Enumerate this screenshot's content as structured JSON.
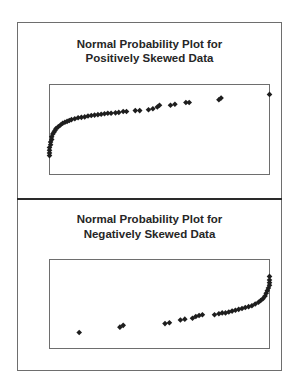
{
  "chart_data": [
    {
      "type": "scatter",
      "title": "Normal Probability Plot for Positively Skewed Data",
      "title_lines": [
        "Normal Probability Plot for",
        "Positively Skewed Data"
      ],
      "xlabel": "",
      "ylabel": "",
      "grid": false,
      "legend": null,
      "note": "Coordinates are normalized within plot area (x: 0=left,1=right; y: 0=bottom,1=top); no axis ticks shown",
      "points": [
        [
          0.0,
          0.21
        ],
        [
          0.0,
          0.24
        ],
        [
          0.0,
          0.27
        ],
        [
          0.0,
          0.3
        ],
        [
          0.005,
          0.33
        ],
        [
          0.005,
          0.36
        ],
        [
          0.01,
          0.39
        ],
        [
          0.01,
          0.42
        ],
        [
          0.015,
          0.45
        ],
        [
          0.02,
          0.47
        ],
        [
          0.025,
          0.49
        ],
        [
          0.03,
          0.51
        ],
        [
          0.04,
          0.53
        ],
        [
          0.05,
          0.55
        ],
        [
          0.06,
          0.57
        ],
        [
          0.07,
          0.58
        ],
        [
          0.08,
          0.59
        ],
        [
          0.09,
          0.6
        ],
        [
          0.1,
          0.61
        ],
        [
          0.115,
          0.62
        ],
        [
          0.13,
          0.63
        ],
        [
          0.145,
          0.635
        ],
        [
          0.16,
          0.64
        ],
        [
          0.175,
          0.65
        ],
        [
          0.19,
          0.655
        ],
        [
          0.205,
          0.66
        ],
        [
          0.22,
          0.665
        ],
        [
          0.235,
          0.67
        ],
        [
          0.25,
          0.675
        ],
        [
          0.265,
          0.68
        ],
        [
          0.28,
          0.68
        ],
        [
          0.3,
          0.685
        ],
        [
          0.315,
          0.69
        ],
        [
          0.335,
          0.7
        ],
        [
          0.35,
          0.7
        ],
        [
          0.39,
          0.71
        ],
        [
          0.41,
          0.71
        ],
        [
          0.45,
          0.72
        ],
        [
          0.47,
          0.73
        ],
        [
          0.49,
          0.75
        ],
        [
          0.5,
          0.77
        ],
        [
          0.55,
          0.77
        ],
        [
          0.57,
          0.78
        ],
        [
          0.62,
          0.8
        ],
        [
          0.635,
          0.8
        ],
        [
          0.77,
          0.83
        ],
        [
          0.78,
          0.85
        ],
        [
          1.0,
          0.89
        ]
      ]
    },
    {
      "type": "scatter",
      "title": "Normal Probability Plot for Negatively Skewed Data",
      "title_lines": [
        "Normal Probability Plot for",
        "Negatively Skewed Data"
      ],
      "xlabel": "",
      "ylabel": "",
      "grid": false,
      "legend": null,
      "note": "Coordinates are normalized within plot area (x: 0=left,1=right; y: 0=bottom,1=top); no axis ticks shown",
      "points": [
        [
          0.135,
          0.18
        ],
        [
          0.32,
          0.24
        ],
        [
          0.335,
          0.26
        ],
        [
          0.525,
          0.28
        ],
        [
          0.545,
          0.29
        ],
        [
          0.595,
          0.32
        ],
        [
          0.615,
          0.33
        ],
        [
          0.65,
          0.34
        ],
        [
          0.665,
          0.36
        ],
        [
          0.68,
          0.37
        ],
        [
          0.695,
          0.38
        ],
        [
          0.75,
          0.38
        ],
        [
          0.77,
          0.39
        ],
        [
          0.785,
          0.4
        ],
        [
          0.8,
          0.4
        ],
        [
          0.815,
          0.41
        ],
        [
          0.83,
          0.42
        ],
        [
          0.845,
          0.43
        ],
        [
          0.86,
          0.44
        ],
        [
          0.875,
          0.45
        ],
        [
          0.89,
          0.46
        ],
        [
          0.905,
          0.47
        ],
        [
          0.92,
          0.48
        ],
        [
          0.935,
          0.5
        ],
        [
          0.95,
          0.52
        ],
        [
          0.96,
          0.54
        ],
        [
          0.97,
          0.56
        ],
        [
          0.98,
          0.59
        ],
        [
          0.985,
          0.62
        ],
        [
          0.99,
          0.65
        ],
        [
          0.995,
          0.68
        ],
        [
          1.0,
          0.71
        ],
        [
          1.0,
          0.74
        ],
        [
          1.0,
          0.77
        ],
        [
          1.0,
          0.81
        ]
      ]
    }
  ],
  "panels": {
    "top": {
      "title_line1": "Normal Probability Plot for",
      "title_line2": "Positively Skewed Data"
    },
    "bottom": {
      "title_line1": "Normal Probability Plot for",
      "title_line2": "Negatively Skewed Data"
    }
  },
  "colors": {
    "marker": "#1e1e1e",
    "frame": "#6e6e6e",
    "title": "#262626"
  }
}
